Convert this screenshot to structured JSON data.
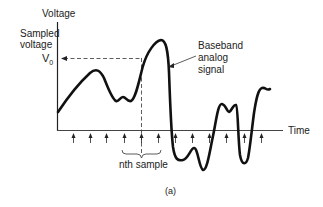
{
  "figure": {
    "y_axis_label": "Voltage",
    "sampled_label_line1": "Sampled",
    "sampled_label_line2": "voltage",
    "v0_label": "V",
    "v0_subscript": "0",
    "signal_label_line1": "Baseband",
    "signal_label_line2": "analog",
    "signal_label_line3": "signal",
    "x_axis_label": "Time",
    "sample_label": "nth sample",
    "caption": "(a)",
    "sample_count": 12
  }
}
